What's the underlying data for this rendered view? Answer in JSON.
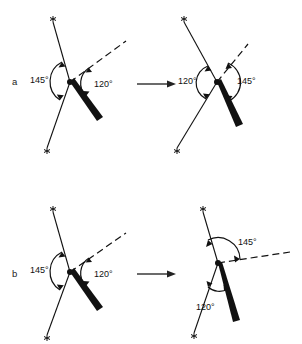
{
  "figure": {
    "title_visible": false,
    "background_color": "#ffffff",
    "ink_color": "#111111",
    "width": 302,
    "height": 344
  },
  "rows": [
    {
      "id": "a",
      "label": "a",
      "transform_arrow": "→",
      "left_diagram": {
        "name": "row-a-left",
        "angles": [
          {
            "value": "145°",
            "position": "left"
          },
          {
            "value": "120°",
            "position": "right"
          }
        ],
        "bonds": [
          {
            "type": "plain-line",
            "terminal": "star",
            "direction": "upper-left"
          },
          {
            "type": "plain-line",
            "terminal": "star",
            "direction": "lower-left"
          },
          {
            "type": "dashed-line",
            "terminal": "none",
            "direction": "upper-right"
          },
          {
            "type": "bold-wedge",
            "terminal": "none",
            "direction": "lower-right"
          }
        ]
      },
      "right_diagram": {
        "name": "row-a-right",
        "angles": [
          {
            "value": "120°",
            "position": "left"
          },
          {
            "value": "145°",
            "position": "right"
          }
        ],
        "bonds": [
          {
            "type": "plain-line",
            "terminal": "star",
            "direction": "upper-left"
          },
          {
            "type": "plain-line",
            "terminal": "star",
            "direction": "lower-left"
          },
          {
            "type": "dashed-line",
            "terminal": "none",
            "direction": "upper-right"
          },
          {
            "type": "bold-wedge",
            "terminal": "none",
            "direction": "lower-right"
          }
        ]
      }
    },
    {
      "id": "b",
      "label": "b",
      "transform_arrow": "→",
      "left_diagram": {
        "name": "row-b-left",
        "angles": [
          {
            "value": "145°",
            "position": "left"
          },
          {
            "value": "120°",
            "position": "right"
          }
        ],
        "bonds": [
          {
            "type": "plain-line",
            "terminal": "star",
            "direction": "upper-left"
          },
          {
            "type": "plain-line",
            "terminal": "star",
            "direction": "lower-left"
          },
          {
            "type": "dashed-line",
            "terminal": "none",
            "direction": "upper-right"
          },
          {
            "type": "bold-wedge",
            "terminal": "none",
            "direction": "lower-right"
          }
        ]
      },
      "right_diagram": {
        "name": "row-b-right",
        "angles": [
          {
            "value": "145°",
            "position": "upper"
          },
          {
            "value": "120°",
            "position": "lower"
          }
        ],
        "bonds": [
          {
            "type": "plain-line",
            "terminal": "star",
            "direction": "upper-left"
          },
          {
            "type": "plain-line",
            "terminal": "star",
            "direction": "lower-left"
          },
          {
            "type": "dashed-line",
            "terminal": "none",
            "direction": "right-horizontal"
          },
          {
            "type": "bold-wedge",
            "terminal": "none",
            "direction": "lower-right"
          }
        ]
      }
    }
  ],
  "legend": {
    "star_marker": "*",
    "degree_symbol": "°"
  }
}
